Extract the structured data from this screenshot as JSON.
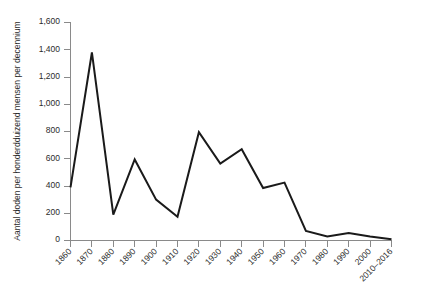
{
  "chart_data": {
    "type": "line",
    "title": "",
    "subtitle": "",
    "xlabel": "",
    "ylabel": "Aantal doden per honderdduizend mensen per decennium",
    "categories": [
      "1860",
      "1870",
      "1880",
      "1890",
      "1900",
      "1910",
      "1920",
      "1930",
      "1940",
      "1950",
      "1960",
      "1970",
      "1980",
      "1990",
      "2000",
      "2010–2016"
    ],
    "values": [
      390,
      1380,
      190,
      595,
      300,
      175,
      795,
      565,
      670,
      385,
      425,
      70,
      30,
      55,
      30,
      10
    ],
    "series": [
      {
        "name": "Aantal doden per honderdduizend mensen per decennium",
        "values": [
          390,
          1380,
          190,
          595,
          300,
          175,
          795,
          565,
          670,
          385,
          425,
          70,
          30,
          55,
          30,
          10
        ]
      }
    ],
    "ylim": [
      0,
      1600
    ],
    "yticks": [
      0,
      200,
      400,
      600,
      800,
      1000,
      1200,
      1400,
      1600
    ],
    "ytick_labels": [
      "0",
      "200",
      "400",
      "600",
      "800",
      "1,000",
      "1,200",
      "1,400",
      "1,600"
    ],
    "grid": false,
    "legend": false,
    "legend_position": "none",
    "line_color": "#1a1a1a",
    "axis_color": "#8a8a8a",
    "background_color": "#ffffff"
  },
  "labels": {
    "y_axis_title": "Aantal doden per honderdduizend mensen per decennium",
    "y_0": "0",
    "y_200": "200",
    "y_400": "400",
    "y_600": "600",
    "y_800": "800",
    "y_1000": "1,000",
    "y_1200": "1,200",
    "y_1400": "1,400",
    "y_1600": "1,600",
    "x_1860": "1860",
    "x_1870": "1870",
    "x_1880": "1880",
    "x_1890": "1890",
    "x_1900": "1900",
    "x_1910": "1910",
    "x_1920": "1920",
    "x_1930": "1930",
    "x_1940": "1940",
    "x_1950": "1950",
    "x_1960": "1960",
    "x_1970": "1970",
    "x_1980": "1980",
    "x_1990": "1990",
    "x_2000": "2000",
    "x_2010_2016": "2010–2016"
  }
}
